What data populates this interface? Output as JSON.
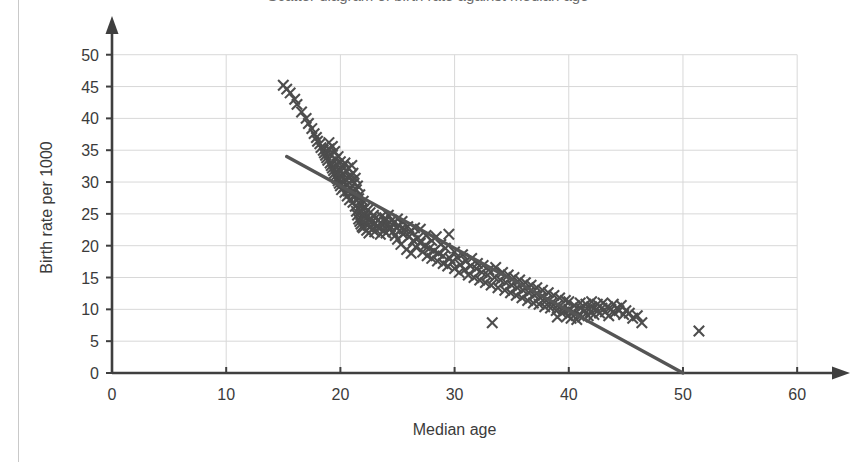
{
  "figure": {
    "clipped_title": "Scatter diagram of birth rate against median age"
  },
  "axis": {
    "x_label": "Median age",
    "y_label": "Birth rate per 1000",
    "x_ticks": [
      "0",
      "10",
      "20",
      "30",
      "40",
      "50",
      "60"
    ],
    "y_ticks": [
      "0",
      "5",
      "10",
      "15",
      "20",
      "25",
      "30",
      "35",
      "40",
      "45",
      "50"
    ]
  },
  "colors": {
    "marker": "#4d4d4d",
    "trendline": "#555555",
    "axis": "#3f3f3f",
    "grid": "#d8d8d8",
    "background": "#ffffff"
  },
  "chart_data": {
    "type": "scatter",
    "title": "Scatter diagram of birth rate against median age",
    "xlabel": "Median age",
    "ylabel": "Birth rate per 1000",
    "xlim": [
      0,
      62
    ],
    "ylim": [
      0,
      52
    ],
    "xticks": [
      0,
      10,
      20,
      30,
      40,
      50,
      60
    ],
    "yticks": [
      0,
      5,
      10,
      15,
      20,
      25,
      30,
      35,
      40,
      45,
      50
    ],
    "grid": true,
    "legend": "none",
    "marker": "x",
    "axis_arrows": true,
    "trendline": {
      "type": "line",
      "x": [
        15.3,
        50.0
      ],
      "y": [
        34.0,
        0.0
      ]
    },
    "points": [
      [
        15.0,
        45.2
      ],
      [
        15.3,
        44.6
      ],
      [
        15.6,
        44.0
      ],
      [
        16.0,
        43.0
      ],
      [
        16.2,
        42.2
      ],
      [
        16.6,
        41.0
      ],
      [
        17.0,
        40.0
      ],
      [
        17.2,
        39.2
      ],
      [
        17.5,
        38.4
      ],
      [
        17.7,
        37.6
      ],
      [
        17.9,
        37.0
      ],
      [
        18.0,
        36.4
      ],
      [
        18.2,
        36.0
      ],
      [
        18.3,
        35.4
      ],
      [
        18.5,
        35.0
      ],
      [
        18.6,
        34.6
      ],
      [
        18.7,
        34.2
      ],
      [
        18.8,
        33.8
      ],
      [
        18.9,
        33.4
      ],
      [
        19.0,
        36.2
      ],
      [
        19.0,
        35.2
      ],
      [
        19.1,
        34.4
      ],
      [
        19.1,
        33.0
      ],
      [
        19.2,
        32.6
      ],
      [
        19.3,
        32.2
      ],
      [
        19.3,
        35.6
      ],
      [
        19.4,
        31.8
      ],
      [
        19.5,
        34.8
      ],
      [
        19.5,
        31.4
      ],
      [
        19.6,
        33.6
      ],
      [
        19.6,
        31.0
      ],
      [
        19.7,
        32.8
      ],
      [
        19.7,
        30.6
      ],
      [
        19.8,
        34.0
      ],
      [
        19.8,
        30.2
      ],
      [
        19.9,
        32.0
      ],
      [
        19.9,
        29.8
      ],
      [
        20.0,
        33.2
      ],
      [
        20.0,
        31.6
      ],
      [
        20.0,
        29.4
      ],
      [
        20.1,
        30.8
      ],
      [
        20.1,
        28.8
      ],
      [
        20.2,
        32.4
      ],
      [
        20.2,
        30.0
      ],
      [
        20.3,
        31.2
      ],
      [
        20.3,
        29.2
      ],
      [
        20.4,
        33.0
      ],
      [
        20.4,
        28.4
      ],
      [
        20.5,
        31.8
      ],
      [
        20.5,
        30.4
      ],
      [
        20.6,
        29.6
      ],
      [
        20.6,
        27.8
      ],
      [
        20.7,
        32.2
      ],
      [
        20.7,
        28.6
      ],
      [
        20.8,
        30.8
      ],
      [
        20.8,
        27.2
      ],
      [
        20.9,
        31.0
      ],
      [
        20.9,
        29.0
      ],
      [
        21.0,
        32.6
      ],
      [
        21.0,
        30.2
      ],
      [
        21.0,
        28.2
      ],
      [
        21.1,
        31.4
      ],
      [
        21.1,
        26.8
      ],
      [
        21.2,
        29.8
      ],
      [
        21.2,
        27.6
      ],
      [
        21.3,
        30.6
      ],
      [
        21.3,
        26.2
      ],
      [
        21.4,
        28.8
      ],
      [
        21.4,
        25.4
      ],
      [
        21.5,
        29.4
      ],
      [
        21.5,
        24.8
      ],
      [
        21.6,
        27.4
      ],
      [
        21.6,
        24.2
      ],
      [
        21.7,
        28.0
      ],
      [
        21.7,
        23.8
      ],
      [
        21.8,
        26.4
      ],
      [
        21.8,
        23.4
      ],
      [
        21.9,
        25.8
      ],
      [
        21.9,
        23.0
      ],
      [
        22.0,
        27.0
      ],
      [
        22.0,
        24.6
      ],
      [
        22.0,
        22.8
      ],
      [
        22.1,
        25.0
      ],
      [
        22.2,
        26.0
      ],
      [
        22.2,
        23.6
      ],
      [
        22.3,
        24.4
      ],
      [
        22.3,
        22.4
      ],
      [
        22.4,
        25.6
      ],
      [
        22.4,
        23.2
      ],
      [
        22.5,
        24.0
      ],
      [
        22.5,
        22.0
      ],
      [
        22.6,
        25.2
      ],
      [
        22.6,
        23.0
      ],
      [
        22.7,
        24.2
      ],
      [
        22.8,
        23.8
      ],
      [
        22.8,
        22.6
      ],
      [
        22.9,
        24.8
      ],
      [
        23.0,
        23.4
      ],
      [
        23.0,
        22.2
      ],
      [
        23.1,
        24.4
      ],
      [
        23.2,
        23.0
      ],
      [
        23.3,
        24.0
      ],
      [
        23.4,
        22.8
      ],
      [
        23.5,
        23.6
      ],
      [
        23.5,
        21.8
      ],
      [
        23.6,
        24.6
      ],
      [
        23.7,
        23.2
      ],
      [
        23.8,
        22.4
      ],
      [
        23.9,
        23.8
      ],
      [
        24.0,
        24.2
      ],
      [
        24.0,
        22.0
      ],
      [
        24.1,
        23.4
      ],
      [
        24.2,
        24.8
      ],
      [
        24.3,
        22.6
      ],
      [
        24.4,
        23.0
      ],
      [
        24.5,
        24.0
      ],
      [
        24.6,
        22.2
      ],
      [
        24.7,
        23.6
      ],
      [
        24.8,
        21.6
      ],
      [
        24.9,
        22.8
      ],
      [
        25.0,
        24.2
      ],
      [
        25.0,
        21.0
      ],
      [
        25.1,
        23.2
      ],
      [
        25.2,
        22.4
      ],
      [
        25.3,
        20.2
      ],
      [
        25.4,
        23.8
      ],
      [
        25.5,
        21.8
      ],
      [
        25.6,
        22.6
      ],
      [
        25.8,
        19.4
      ],
      [
        25.9,
        23.0
      ],
      [
        26.0,
        21.4
      ],
      [
        26.1,
        22.2
      ],
      [
        26.2,
        18.8
      ],
      [
        26.4,
        20.8
      ],
      [
        26.5,
        22.8
      ],
      [
        26.6,
        19.8
      ],
      [
        26.8,
        21.2
      ],
      [
        27.0,
        20.4
      ],
      [
        27.0,
        22.6
      ],
      [
        27.2,
        19.0
      ],
      [
        27.4,
        20.0
      ],
      [
        27.5,
        21.6
      ],
      [
        27.6,
        18.4
      ],
      [
        27.8,
        19.6
      ],
      [
        28.0,
        20.8
      ],
      [
        28.0,
        18.0
      ],
      [
        28.2,
        19.2
      ],
      [
        28.4,
        21.4
      ],
      [
        28.5,
        17.6
      ],
      [
        28.6,
        18.8
      ],
      [
        28.8,
        20.2
      ],
      [
        29.0,
        17.2
      ],
      [
        29.0,
        18.4
      ],
      [
        29.2,
        19.6
      ],
      [
        29.4,
        16.8
      ],
      [
        29.5,
        21.8
      ],
      [
        29.6,
        18.0
      ],
      [
        29.8,
        17.4
      ],
      [
        30.0,
        19.0
      ],
      [
        30.0,
        16.4
      ],
      [
        30.2,
        18.2
      ],
      [
        30.4,
        15.8
      ],
      [
        30.5,
        17.0
      ],
      [
        30.7,
        18.6
      ],
      [
        30.9,
        16.2
      ],
      [
        31.0,
        17.6
      ],
      [
        31.2,
        15.4
      ],
      [
        31.4,
        16.8
      ],
      [
        31.5,
        18.0
      ],
      [
        31.7,
        15.0
      ],
      [
        31.9,
        16.4
      ],
      [
        32.0,
        17.2
      ],
      [
        32.2,
        14.6
      ],
      [
        32.4,
        15.8
      ],
      [
        32.5,
        16.9
      ],
      [
        32.7,
        14.2
      ],
      [
        32.9,
        15.4
      ],
      [
        33.0,
        16.2
      ],
      [
        33.2,
        13.8
      ],
      [
        33.3,
        7.9
      ],
      [
        33.5,
        15.0
      ],
      [
        33.6,
        16.6
      ],
      [
        33.8,
        13.4
      ],
      [
        34.0,
        14.6
      ],
      [
        34.2,
        15.8
      ],
      [
        34.4,
        13.0
      ],
      [
        34.5,
        14.2
      ],
      [
        34.7,
        15.4
      ],
      [
        34.9,
        12.6
      ],
      [
        35.0,
        13.8
      ],
      [
        35.2,
        15.0
      ],
      [
        35.4,
        12.2
      ],
      [
        35.5,
        13.4
      ],
      [
        35.7,
        14.6
      ],
      [
        35.9,
        11.8
      ],
      [
        36.0,
        13.0
      ],
      [
        36.2,
        14.2
      ],
      [
        36.4,
        11.4
      ],
      [
        36.5,
        12.6
      ],
      [
        36.7,
        13.8
      ],
      [
        36.9,
        11.0
      ],
      [
        37.0,
        12.2
      ],
      [
        37.2,
        13.4
      ],
      [
        37.4,
        10.8
      ],
      [
        37.5,
        11.8
      ],
      [
        37.7,
        13.0
      ],
      [
        37.9,
        10.4
      ],
      [
        38.0,
        11.4
      ],
      [
        38.2,
        12.6
      ],
      [
        38.4,
        10.2
      ],
      [
        38.5,
        11.0
      ],
      [
        38.7,
        12.2
      ],
      [
        38.9,
        9.8
      ],
      [
        39.0,
        10.6
      ],
      [
        39.0,
        8.8
      ],
      [
        39.2,
        11.8
      ],
      [
        39.4,
        9.4
      ],
      [
        39.5,
        10.2
      ],
      [
        39.7,
        11.4
      ],
      [
        39.9,
        9.0
      ],
      [
        40.0,
        10.0
      ],
      [
        40.0,
        11.2
      ],
      [
        40.2,
        8.6
      ],
      [
        40.4,
        9.6
      ],
      [
        40.5,
        10.6
      ],
      [
        40.7,
        8.4
      ],
      [
        40.9,
        9.2
      ],
      [
        41.0,
        10.2
      ],
      [
        41.0,
        11.0
      ],
      [
        41.2,
        8.8
      ],
      [
        41.4,
        9.8
      ],
      [
        41.5,
        10.8
      ],
      [
        41.7,
        9.0
      ],
      [
        41.9,
        9.6
      ],
      [
        42.0,
        10.4
      ],
      [
        42.0,
        11.2
      ],
      [
        42.2,
        9.2
      ],
      [
        42.4,
        10.0
      ],
      [
        42.5,
        10.8
      ],
      [
        42.7,
        9.4
      ],
      [
        42.9,
        10.2
      ],
      [
        43.0,
        11.0
      ],
      [
        43.2,
        9.6
      ],
      [
        43.4,
        10.4
      ],
      [
        43.5,
        9.0
      ],
      [
        43.7,
        10.0
      ],
      [
        43.9,
        10.8
      ],
      [
        44.0,
        9.4
      ],
      [
        44.2,
        10.2
      ],
      [
        44.4,
        9.8
      ],
      [
        44.6,
        10.6
      ],
      [
        44.8,
        9.2
      ],
      [
        45.0,
        9.8
      ],
      [
        45.3,
        9.4
      ],
      [
        45.6,
        8.6
      ],
      [
        46.0,
        9.0
      ],
      [
        46.4,
        7.9
      ],
      [
        51.4,
        6.6
      ]
    ]
  }
}
